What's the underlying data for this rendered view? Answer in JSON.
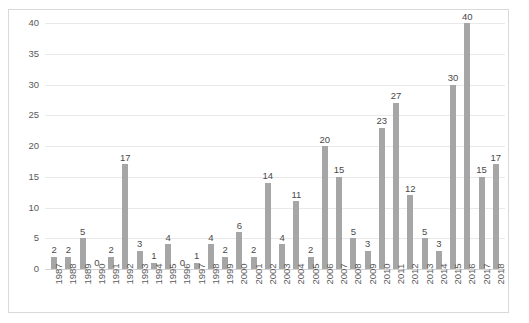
{
  "chart_data": {
    "type": "bar",
    "title": "",
    "subtitle": "",
    "xlabel": "",
    "ylabel": "",
    "categories": [
      "1987",
      "1988",
      "1989",
      "1990",
      "1991",
      "1992",
      "1993",
      "1994",
      "1995",
      "1996",
      "1997",
      "1998",
      "1999",
      "2000",
      "2001",
      "2002",
      "2003",
      "2004",
      "2005",
      "2006",
      "2007",
      "2008",
      "2009",
      "2010",
      "2011",
      "2012",
      "2013",
      "2014",
      "2015",
      "2016",
      "2017",
      "2018"
    ],
    "values": [
      2,
      2,
      5,
      0,
      2,
      17,
      3,
      1,
      4,
      0,
      1,
      4,
      2,
      6,
      2,
      14,
      4,
      11,
      2,
      20,
      15,
      5,
      3,
      23,
      27,
      12,
      5,
      3,
      30,
      40,
      15,
      17
    ],
    "data_labels": [
      "2",
      "2",
      "5",
      "0",
      "2",
      "17",
      "3",
      "1",
      "4",
      "0",
      "1",
      "4",
      "2",
      "6",
      "2",
      "14",
      "4",
      "11",
      "2",
      "20",
      "15",
      "5",
      "3",
      "23",
      "27",
      "12",
      "5",
      "3",
      "30",
      "40",
      "15",
      "17"
    ],
    "ylim": [
      0,
      40
    ],
    "yticks": [
      0,
      5,
      10,
      15,
      20,
      25,
      30,
      35,
      40
    ],
    "ytick_labels": [
      "0",
      "5",
      "10",
      "15",
      "20",
      "25",
      "30",
      "35",
      "40"
    ],
    "grid": true,
    "grid_axis": "y",
    "legend": false,
    "legend_position": "none",
    "series": [
      {
        "name": "",
        "values": [
          2,
          2,
          5,
          0,
          2,
          17,
          3,
          1,
          4,
          0,
          1,
          4,
          2,
          6,
          2,
          14,
          4,
          11,
          2,
          20,
          15,
          5,
          3,
          23,
          27,
          12,
          5,
          3,
          30,
          40,
          15,
          17
        ]
      }
    ],
    "colors": {
      "bar": "#a6a6a6",
      "gridline": "#e9e9e9",
      "baseline": "#d2d2d2",
      "border": "#d9d9d9",
      "tick_text": "#5a5a5a",
      "data_label_text": "#4a4a4a",
      "background": "#ffffff"
    }
  }
}
